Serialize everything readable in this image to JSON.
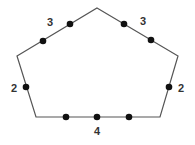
{
  "diagram": {
    "type": "pentagon-with-points",
    "stroke_color": "#555555",
    "dot_color": "#111111",
    "label_color": "#333333",
    "vertices": [
      {
        "id": "top",
        "x": 97,
        "y": 8
      },
      {
        "id": "upper-right",
        "x": 178,
        "y": 56
      },
      {
        "id": "lower-right",
        "x": 160,
        "y": 117
      },
      {
        "id": "lower-left",
        "x": 36,
        "y": 117
      },
      {
        "id": "upper-left",
        "x": 17,
        "y": 56
      }
    ],
    "edges": [
      {
        "name": "upper-left-edge",
        "label": "3",
        "label_pos": {
          "x": 50,
          "y": 26
        },
        "points": [
          {
            "x": 43,
            "y": 41
          },
          {
            "x": 70,
            "y": 24
          }
        ]
      },
      {
        "name": "upper-right-edge",
        "label": "3",
        "label_pos": {
          "x": 143,
          "y": 25
        },
        "points": [
          {
            "x": 124,
            "y": 24
          },
          {
            "x": 151,
            "y": 40
          }
        ]
      },
      {
        "name": "left-edge",
        "label": "2",
        "label_pos": {
          "x": 14,
          "y": 92
        },
        "points": [
          {
            "x": 26,
            "y": 87
          }
        ]
      },
      {
        "name": "right-edge",
        "label": "2",
        "label_pos": {
          "x": 181,
          "y": 92
        },
        "points": [
          {
            "x": 169,
            "y": 87
          }
        ]
      },
      {
        "name": "bottom-edge",
        "label": "4",
        "label_pos": {
          "x": 97,
          "y": 135
        },
        "points": [
          {
            "x": 66,
            "y": 117
          },
          {
            "x": 97,
            "y": 117
          },
          {
            "x": 129,
            "y": 117
          }
        ]
      }
    ]
  }
}
